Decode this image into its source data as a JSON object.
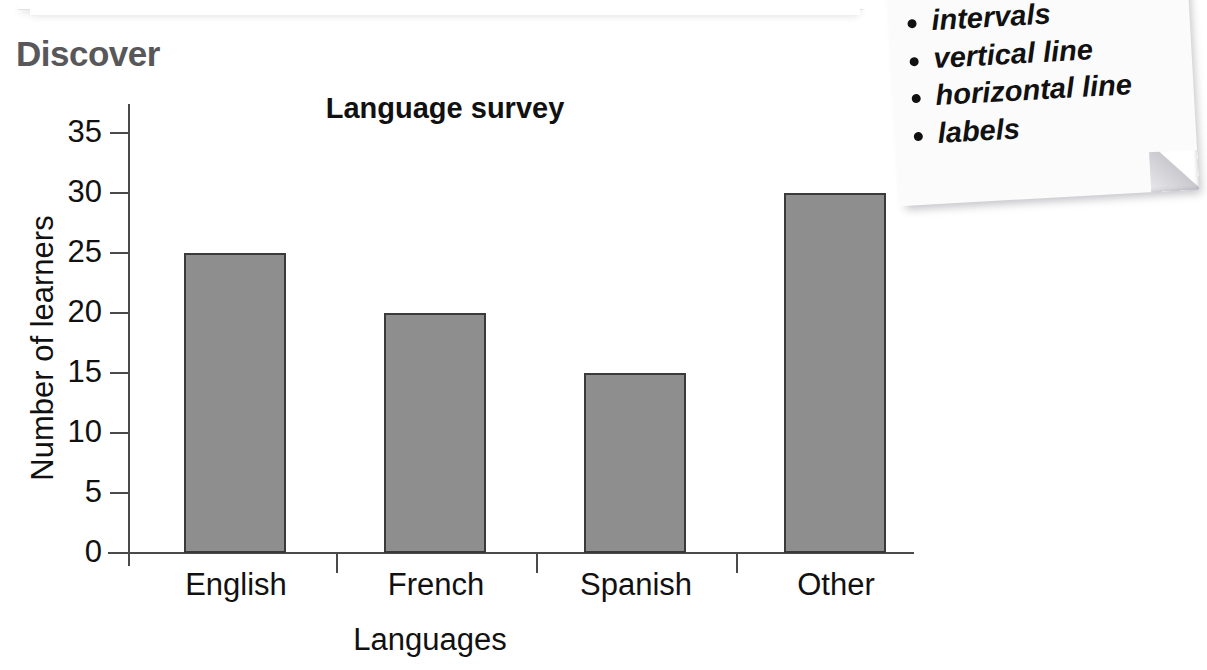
{
  "section": {
    "heading": "Discover",
    "heading_color": "#58585a"
  },
  "note": {
    "name": "sticky-note",
    "items": [
      "intervals",
      "vertical line",
      "horizontal line",
      "labels"
    ]
  },
  "chart_data": {
    "type": "bar",
    "title": "Language survey",
    "xlabel": "Languages",
    "ylabel": "Number of learners",
    "categories": [
      "English",
      "French",
      "Spanish",
      "Other"
    ],
    "values": [
      25,
      20,
      15,
      30
    ],
    "yticks": [
      0,
      5,
      10,
      15,
      20,
      25,
      30,
      35
    ],
    "ylim": [
      0,
      35
    ],
    "grid": false,
    "legend": false,
    "bar_color": "#8e8e8e",
    "bar_border_color": "#3a3a3a",
    "axis_color": "#4a4a4a"
  }
}
